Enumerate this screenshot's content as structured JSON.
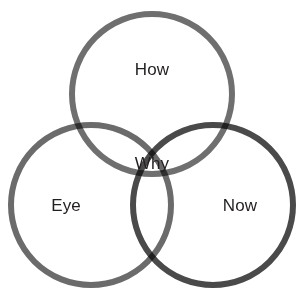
{
  "diagram": {
    "type": "venn-3-circle",
    "background_color": "#ffffff",
    "label_color": "#231f20",
    "stroke_width": 6,
    "circles": [
      {
        "id": "top",
        "name": "how-circle",
        "label": "How",
        "cx": 152,
        "cy": 94,
        "r": 80,
        "color": "#6f6f6f"
      },
      {
        "id": "bottom-left",
        "name": "eye-circle",
        "label": "Eye",
        "cx": 91,
        "cy": 205,
        "r": 80,
        "color": "#6b6b6b"
      },
      {
        "id": "bottom-right",
        "name": "now-circle",
        "label": "Now",
        "cx": 213,
        "cy": 205,
        "r": 80,
        "color": "#4a4a4a"
      }
    ],
    "labels": {
      "top": "How",
      "left": "Eye",
      "right": "Now",
      "center": "Why"
    }
  }
}
